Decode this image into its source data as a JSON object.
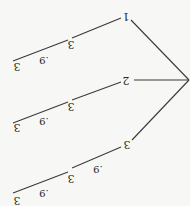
{
  "diagram": {
    "type": "tree",
    "orientation": "rotated 180 degrees (upside down)",
    "root": {
      "x": 189,
      "y": 80
    },
    "branches": [
      {
        "label": "1",
        "label_pos": {
          "x": 126,
          "y": 16
        },
        "edge_from_root_to": {
          "x": 131,
          "y": 20
        },
        "segments": [
          {
            "from": {
              "x": 121,
              "y": 18
            },
            "to": {
              "x": 72,
              "y": 38
            },
            "end_label": "3",
            "end_label_pos": {
              "x": 71,
              "y": 44
            }
          },
          {
            "from": {
              "x": 68,
              "y": 40
            },
            "to": {
              "x": 13,
              "y": 61
            },
            "end_label": "3",
            "end_label_pos": {
              "x": 17,
              "y": 66
            },
            "mid_label": ".9",
            "mid_label_pos": {
              "x": 44,
              "y": 60
            }
          }
        ]
      },
      {
        "label": "2",
        "label_pos": {
          "x": 126,
          "y": 80
        },
        "edge_from_root_to": {
          "x": 134,
          "y": 80
        },
        "segments": [
          {
            "from": {
              "x": 121,
              "y": 82
            },
            "to": {
              "x": 72,
              "y": 100
            },
            "end_label": "3",
            "end_label_pos": {
              "x": 71,
              "y": 106
            }
          },
          {
            "from": {
              "x": 68,
              "y": 102
            },
            "to": {
              "x": 13,
              "y": 123
            },
            "end_label": "3",
            "end_label_pos": {
              "x": 17,
              "y": 127
            },
            "mid_label": ".9",
            "mid_label_pos": {
              "x": 44,
              "y": 121
            }
          }
        ]
      },
      {
        "label": "3",
        "label_pos": {
          "x": 127,
          "y": 144
        },
        "edge_from_root_to": {
          "x": 132,
          "y": 140
        },
        "segments": [
          {
            "from": {
              "x": 121,
              "y": 147
            },
            "to": {
              "x": 72,
              "y": 168
            },
            "end_label": "3",
            "end_label_pos": {
              "x": 71,
              "y": 178
            },
            "mid_label": ".9",
            "mid_label_pos": {
              "x": 98,
              "y": 169
            }
          },
          {
            "from": {
              "x": 68,
              "y": 172
            },
            "to": {
              "x": 13,
              "y": 193
            },
            "end_label": "3",
            "end_label_pos": {
              "x": 17,
              "y": 200
            },
            "mid_label": ".9",
            "mid_label_pos": {
              "x": 44,
              "y": 193
            }
          }
        ]
      }
    ]
  },
  "labels": {
    "b1": "1",
    "b2": "2",
    "b3": "3",
    "b1_n1": "3",
    "b1_n2": "3",
    "b1_p2": ".9",
    "b2_n1": "3",
    "b2_n2": "3",
    "b2_p2": ".9",
    "b3_n1": "3",
    "b3_p1": ".9",
    "b3_n2": "3",
    "b3_p2": ".9"
  },
  "colors": {
    "background": "#f7f7f5",
    "line": "#3a3a3a",
    "text": "#2a2a2a"
  }
}
